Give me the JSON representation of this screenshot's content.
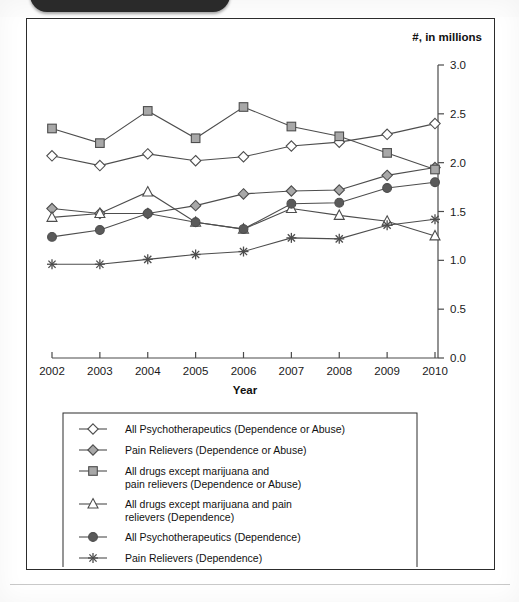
{
  "window": {
    "top_pill_name": "dark-rounded-header-bar"
  },
  "figure": {
    "unit_label": "#, in millions",
    "xlabel": "Year",
    "ylabel": ""
  },
  "chart_data": {
    "type": "line",
    "title": "",
    "xlabel": "Year",
    "ylabel": "",
    "unit_label": "#, in millions",
    "categories": [
      "2002",
      "2003",
      "2004",
      "2005",
      "2006",
      "2007",
      "2008",
      "2009",
      "2010"
    ],
    "x": [
      2002,
      2003,
      2004,
      2005,
      2006,
      2007,
      2008,
      2009,
      2010
    ],
    "xlim": [
      2002,
      2010
    ],
    "ylim": [
      0.0,
      3.0
    ],
    "ytick_labels": [
      "0.0",
      "0.5",
      "1.0",
      "1.5",
      "2.0",
      "2.5",
      "3.0"
    ],
    "yticks": [
      0.0,
      0.5,
      1.0,
      1.5,
      2.0,
      2.5,
      3.0
    ],
    "grid": false,
    "legend_position": "below-plot",
    "series": [
      {
        "name": "All Psychotherapeutics (Dependence or Abuse)",
        "marker": "open-diamond",
        "values": [
          2.07,
          1.97,
          2.09,
          2.02,
          2.06,
          2.17,
          2.21,
          2.29,
          2.4
        ]
      },
      {
        "name": "Pain Relievers (Dependence or Abuse)",
        "marker": "filled-diamond",
        "values": [
          1.53,
          1.48,
          1.48,
          1.56,
          1.68,
          1.71,
          1.72,
          1.87,
          1.95
        ]
      },
      {
        "name": "All drugs except marijuana and pain relievers (Dependence or Abuse)",
        "marker": "open-square",
        "values": [
          2.35,
          2.2,
          2.53,
          2.25,
          2.57,
          2.37,
          2.27,
          2.1,
          1.93
        ]
      },
      {
        "name": "All drugs except marijuana and pain relievers (Dependence)",
        "marker": "open-triangle",
        "values": [
          1.44,
          1.48,
          1.7,
          1.39,
          1.32,
          1.53,
          1.46,
          1.4,
          1.25
        ]
      },
      {
        "name": "All Psychotherapeutics (Dependence)",
        "marker": "filled-circle",
        "values": [
          1.24,
          1.31,
          1.48,
          1.39,
          1.32,
          1.58,
          1.59,
          1.74,
          1.8
        ]
      },
      {
        "name": "Pain Relievers (Dependence)",
        "marker": "star",
        "values": [
          0.96,
          0.96,
          1.01,
          1.06,
          1.09,
          1.23,
          1.22,
          1.36,
          1.42
        ]
      }
    ]
  },
  "legend": {
    "items": [
      {
        "marker": "open-diamond",
        "label": "All Psychotherapeutics (Dependence or Abuse)",
        "line2": ""
      },
      {
        "marker": "filled-diamond",
        "label": "Pain Relievers (Dependence or Abuse)",
        "line2": ""
      },
      {
        "marker": "open-square",
        "label": "All drugs except marijuana and",
        "line2": "pain relievers (Dependence or Abuse)"
      },
      {
        "marker": "open-triangle",
        "label": "All drugs except marijuana and pain",
        "line2": "relievers (Dependence)"
      },
      {
        "marker": "filled-circle",
        "label": "All Psychotherapeutics (Dependence)",
        "line2": ""
      },
      {
        "marker": "star",
        "label": "Pain Relievers (Dependence)",
        "line2": ""
      }
    ]
  },
  "colors": {
    "line": "#4d4d4d",
    "marker_fill_light": "#a8a8a8",
    "marker_fill_dark": "#5a5a5a",
    "axis": "#4a4a4a",
    "frame": "#2c2c2c",
    "text": "#111111"
  }
}
